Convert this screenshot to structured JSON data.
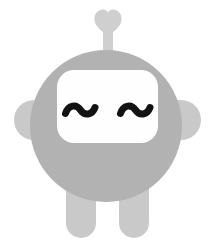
{
  "canvas": {
    "width": 215,
    "height": 246,
    "background": "#ffffff",
    "title": "Robot mascot illustration"
  },
  "palette": {
    "body_gray": "#b2b2b2",
    "limb_gray": "#c9c9c9",
    "antenna_gray": "#cfcfcf",
    "screen_white": "#fefefe",
    "eye_black": "#121212",
    "background": "#ffffff"
  },
  "figure": {
    "name": "robot-mascot",
    "mood": "content",
    "parts": [
      {
        "id": "antenna-heart",
        "label": "Heart antenna topper",
        "shape": "heart",
        "color": "#cfcfcf",
        "center_x": 108,
        "center_y": 24,
        "width": 28,
        "height": 27
      },
      {
        "id": "antenna-stem",
        "label": "Antenna stem",
        "shape": "rounded-rect",
        "color": "#cfcfcf",
        "x": 103,
        "y": 30,
        "width": 10,
        "height": 28
      },
      {
        "id": "arm-left",
        "label": "Left arm",
        "shape": "capsule",
        "color": "#c9c9c9",
        "x": 14,
        "y": 100,
        "width": 52,
        "height": 40,
        "radius": 20
      },
      {
        "id": "arm-right",
        "label": "Right arm",
        "shape": "capsule",
        "color": "#c9c9c9",
        "x": 149,
        "y": 100,
        "width": 52,
        "height": 40,
        "radius": 20
      },
      {
        "id": "leg-left",
        "label": "Left leg",
        "shape": "capsule",
        "color": "#c9c9c9",
        "x": 66,
        "y": 176,
        "width": 30,
        "height": 62,
        "radius": 15
      },
      {
        "id": "leg-right",
        "label": "Right leg",
        "shape": "capsule",
        "color": "#c9c9c9",
        "x": 119,
        "y": 176,
        "width": 30,
        "height": 62,
        "radius": 15
      },
      {
        "id": "head-body",
        "label": "Head and body",
        "shape": "circle",
        "color": "#b2b2b2",
        "center_x": 106,
        "center_y": 126,
        "radius": 76
      },
      {
        "id": "face-screen",
        "label": "Face screen",
        "shape": "rounded-rect",
        "color": "#fefefe",
        "x": 57,
        "y": 70,
        "width": 101,
        "height": 73,
        "radius": 17
      },
      {
        "id": "eye-left",
        "label": "Left eye",
        "shape": "tilde",
        "color": "#121212",
        "center_x": 80,
        "center_y": 112,
        "width": 32,
        "height": 16,
        "stroke_width": 7
      },
      {
        "id": "eye-right",
        "label": "Right eye",
        "shape": "tilde",
        "color": "#121212",
        "center_x": 135,
        "center_y": 112,
        "width": 32,
        "height": 16,
        "stroke_width": 7
      }
    ]
  }
}
